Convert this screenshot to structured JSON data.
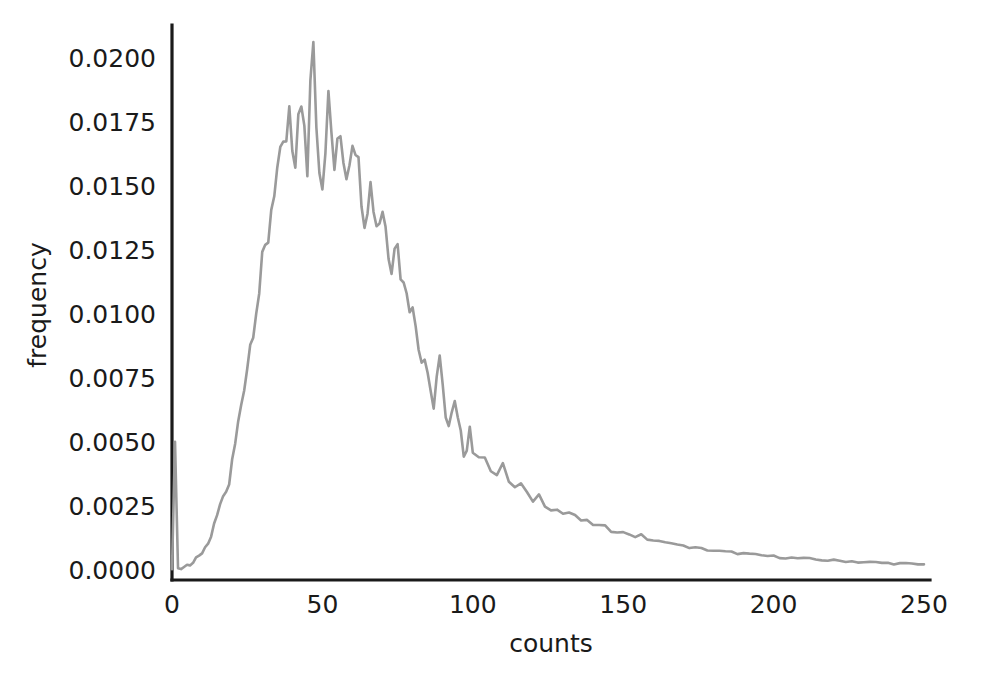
{
  "chart_data": {
    "type": "line",
    "title": "",
    "subtitle": "",
    "xlabel": "counts",
    "ylabel": "frequency",
    "xlim": [
      0,
      252
    ],
    "ylim": [
      -0.0004,
      0.0213
    ],
    "grid": false,
    "legend": null,
    "line_color": "#9a9a9a",
    "axis_color": "#1a1a1a",
    "background_color": "#ffffff",
    "xticks": [
      0,
      50,
      100,
      150,
      200,
      250
    ],
    "xtick_labels": [
      "0",
      "50",
      "100",
      "150",
      "200",
      "250"
    ],
    "yticks": [
      0.0,
      0.0025,
      0.005,
      0.0075,
      0.01,
      0.0125,
      0.015,
      0.0175,
      0.02
    ],
    "ytick_labels": [
      "0.0000",
      "0.0025",
      "0.0050",
      "0.0075",
      "0.0100",
      "0.0125",
      "0.0150",
      "0.0175",
      "0.0200"
    ],
    "peak_x": 38,
    "peak_y": 0.0206,
    "zero_spike_y": 0.005,
    "tail_level": 0.0002,
    "x": [
      0,
      1,
      2,
      3,
      4,
      5,
      6,
      7,
      8,
      9,
      10,
      11,
      12,
      13,
      14,
      15,
      16,
      17,
      18,
      19,
      20,
      21,
      22,
      23,
      24,
      25,
      26,
      27,
      28,
      29,
      30,
      31,
      32,
      33,
      34,
      35,
      36,
      37,
      38,
      39,
      40,
      41,
      42,
      43,
      44,
      45,
      46,
      47,
      48,
      49,
      50,
      51,
      52,
      53,
      54,
      55,
      56,
      57,
      58,
      59,
      60,
      61,
      62,
      63,
      64,
      65,
      66,
      67,
      68,
      69,
      70,
      71,
      72,
      73,
      74,
      75,
      76,
      77,
      78,
      79,
      80,
      81,
      82,
      83,
      84,
      85,
      86,
      87,
      88,
      89,
      90,
      91,
      92,
      93,
      94,
      95,
      96,
      97,
      98,
      99,
      100,
      102,
      104,
      106,
      108,
      110,
      112,
      114,
      116,
      118,
      120,
      122,
      124,
      126,
      128,
      130,
      132,
      134,
      136,
      138,
      140,
      142,
      144,
      146,
      148,
      150,
      152,
      154,
      156,
      158,
      160,
      162,
      164,
      166,
      168,
      170,
      172,
      174,
      176,
      178,
      180,
      182,
      184,
      186,
      188,
      190,
      192,
      194,
      196,
      198,
      200,
      202,
      204,
      206,
      208,
      210,
      212,
      214,
      216,
      218,
      220,
      222,
      224,
      226,
      228,
      230,
      232,
      234,
      236,
      238,
      240,
      242,
      244,
      246,
      248,
      250
    ],
    "y": [
      2e-05,
      0.005,
      0.0001,
      2e-05,
      0.00012,
      0.0002,
      0.00016,
      0.0003,
      0.0005,
      0.00055,
      0.0006,
      0.00085,
      0.00105,
      0.00125,
      0.00175,
      0.00215,
      0.00245,
      0.0029,
      0.003,
      0.0034,
      0.0042,
      0.0049,
      0.0057,
      0.0065,
      0.0073,
      0.008,
      0.0088,
      0.0096,
      0.0104,
      0.0109,
      0.0118,
      0.0124,
      0.0131,
      0.0142,
      0.0151,
      0.0156,
      0.0157,
      0.016,
      0.0168,
      0.0176,
      0.0162,
      0.015,
      0.0179,
      0.0187,
      0.017,
      0.0149,
      0.0196,
      0.0206,
      0.018,
      0.0162,
      0.0152,
      0.017,
      0.0181,
      0.017,
      0.0158,
      0.0162,
      0.017,
      0.0164,
      0.0156,
      0.0164,
      0.0172,
      0.017,
      0.0156,
      0.015,
      0.014,
      0.0146,
      0.015,
      0.0144,
      0.0136,
      0.0138,
      0.0142,
      0.0134,
      0.0126,
      0.0122,
      0.013,
      0.0126,
      0.0118,
      0.011,
      0.0112,
      0.0106,
      0.01,
      0.0096,
      0.009,
      0.0083,
      0.0086,
      0.0078,
      0.007,
      0.0064,
      0.0076,
      0.008,
      0.007,
      0.0062,
      0.0056,
      0.006,
      0.0064,
      0.0058,
      0.0052,
      0.0046,
      0.0049,
      0.0056,
      0.0047,
      0.0042,
      0.0046,
      0.004,
      0.0037,
      0.004,
      0.0035,
      0.0032,
      0.0033,
      0.0029,
      0.00275,
      0.0029,
      0.0026,
      0.00245,
      0.00235,
      0.0022,
      0.00225,
      0.00205,
      0.00195,
      0.00185,
      0.0018,
      0.0017,
      0.00165,
      0.00155,
      0.0015,
      0.00145,
      0.0014,
      0.0013,
      0.00135,
      0.0012,
      0.00115,
      0.0011,
      0.00105,
      0.00108,
      0.00098,
      0.00092,
      0.00088,
      0.00085,
      0.00082,
      0.00078,
      0.00075,
      0.00072,
      0.0007,
      0.00068,
      0.00065,
      0.00063,
      0.0006,
      0.00058,
      0.00056,
      0.00054,
      0.00052,
      0.0005,
      0.00048,
      0.00046,
      0.00045,
      0.00043,
      0.00042,
      0.0004,
      0.00039,
      0.00037,
      0.00036,
      0.00035,
      0.00034,
      0.00033,
      0.00031,
      0.0003,
      0.00029,
      0.00028,
      0.00027,
      0.00026,
      0.00025,
      0.00024,
      0.00023,
      0.00022,
      0.00021,
      0.0002
    ]
  }
}
